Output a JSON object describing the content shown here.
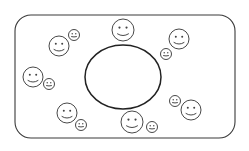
{
  "diagram": {
    "type": "illustration",
    "colors": {
      "stroke": "#333333",
      "background": "#ffffff"
    },
    "container": {
      "shape": "rounded-rectangle",
      "x": 15,
      "y": 15,
      "width": 220,
      "height": 123,
      "radius": 16
    },
    "center": {
      "shape": "ellipse",
      "cx": 123,
      "cy": 77,
      "rx": 38,
      "ry": 32
    },
    "large_faces": [
      {
        "cx": 123,
        "cy": 30,
        "r": 11,
        "expression": "smile"
      },
      {
        "cx": 179,
        "cy": 39,
        "r": 10,
        "expression": "smile"
      },
      {
        "cx": 59,
        "cy": 46,
        "r": 10,
        "expression": "smile"
      },
      {
        "cx": 33,
        "cy": 77,
        "r": 10,
        "expression": "smile"
      },
      {
        "cx": 191,
        "cy": 110,
        "r": 10,
        "expression": "smile"
      },
      {
        "cx": 67,
        "cy": 113,
        "r": 10,
        "expression": "smile"
      },
      {
        "cx": 132,
        "cy": 122,
        "r": 11,
        "expression": "smile"
      }
    ],
    "small_faces": [
      {
        "cx": 74,
        "cy": 35,
        "r": 5.5,
        "expression": "neutral"
      },
      {
        "cx": 166,
        "cy": 54,
        "r": 5.5,
        "expression": "neutral"
      },
      {
        "cx": 49,
        "cy": 84,
        "r": 5.5,
        "expression": "neutral"
      },
      {
        "cx": 175,
        "cy": 101,
        "r": 5.5,
        "expression": "neutral"
      },
      {
        "cx": 81,
        "cy": 125,
        "r": 5.5,
        "expression": "neutral"
      },
      {
        "cx": 152,
        "cy": 127,
        "r": 5.5,
        "expression": "neutral"
      }
    ]
  }
}
